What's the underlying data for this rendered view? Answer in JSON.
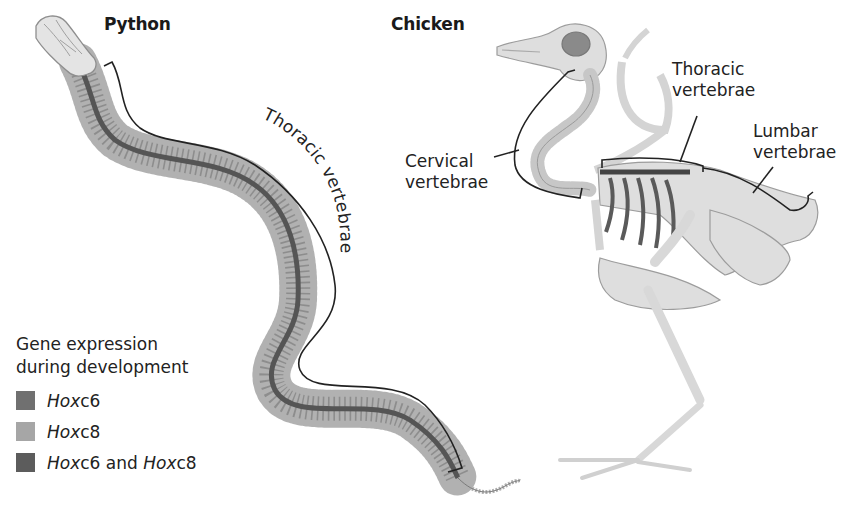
{
  "diagram": {
    "organisms": [
      {
        "name": "Python",
        "regions": [
          {
            "label": "Thoracic vertebrae",
            "label_style": "curved-along-bracket"
          }
        ]
      },
      {
        "name": "Chicken",
        "regions": [
          {
            "label_line1": "Cervical",
            "label_line2": "vertebrae"
          },
          {
            "label_line1": "Thoracic",
            "label_line2": "vertebrae"
          },
          {
            "label_line1": "Lumbar",
            "label_line2": "vertebrae"
          }
        ]
      }
    ],
    "legend": {
      "title_line1": "Gene expression",
      "title_line2": "during development",
      "items": [
        {
          "gene_a": "Hox",
          "gene_a_suffix": "c6",
          "joiner": "",
          "gene_b": "",
          "gene_b_suffix": "",
          "color": "#707070"
        },
        {
          "gene_a": "Hox",
          "gene_a_suffix": "c8",
          "joiner": "",
          "gene_b": "",
          "gene_b_suffix": "",
          "color": "#a6a6a6"
        },
        {
          "gene_a": "Hox",
          "gene_a_suffix": "c6",
          "joiner": " and ",
          "gene_b": "Hox",
          "gene_b_suffix": "c8",
          "color": "#5c5c5c"
        }
      ]
    },
    "colors": {
      "spine_dark": "#555555",
      "rib_light": "#9a9a9a",
      "bone": "#dcdcdc",
      "bone_outline": "#9c9c9c",
      "bracket": "#222222"
    }
  }
}
